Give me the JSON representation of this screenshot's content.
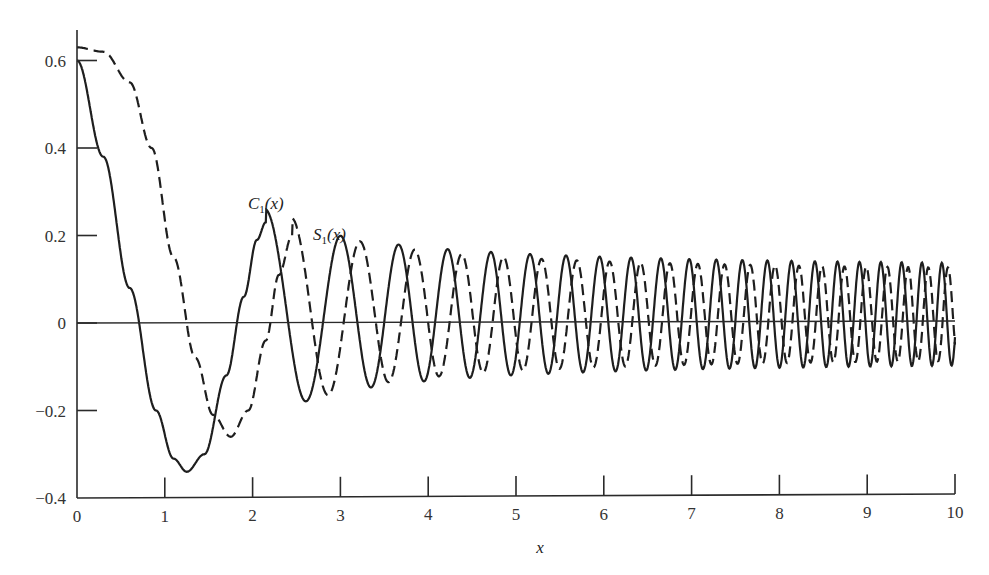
{
  "chart_data": {
    "type": "line",
    "title": "",
    "xlabel": "x",
    "ylabel": "",
    "xlim": [
      0,
      10
    ],
    "ylim": [
      -0.4,
      0.65
    ],
    "grid": false,
    "legend": "inline labels near curves",
    "x_ticks": [
      0,
      1,
      2,
      3,
      4,
      5,
      6,
      7,
      8,
      9,
      10
    ],
    "x_tick_labels": [
      "0",
      "1",
      "2",
      "3",
      "4",
      "5",
      "6",
      "7",
      "8",
      "9",
      "10"
    ],
    "y_ticks": [
      -0.4,
      -0.2,
      0,
      0.2,
      0.4,
      0.6
    ],
    "y_tick_labels": [
      "−0.4",
      "−0.2",
      "0",
      "0.2",
      "0.4",
      "0.6"
    ],
    "zero_line": true,
    "series": [
      {
        "name": "C1(x)",
        "label_main": "C",
        "label_sub": "1",
        "label_arg": "(x)",
        "style": "solid",
        "x": [
          0,
          0.5,
          1.0,
          1.25,
          1.5,
          2.0,
          2.15,
          2.5,
          2.8,
          3.0,
          3.3,
          3.7,
          4.1,
          4.5,
          5.0,
          6.0,
          7.0,
          8.0,
          9.0,
          10.0
        ],
        "y": [
          0.6,
          0.05,
          -0.3,
          -0.34,
          -0.25,
          0.18,
          0.23,
          0.05,
          -0.16,
          -0.12,
          0.15,
          -0.12,
          0.12,
          -0.09,
          0.1,
          0.08,
          0.07,
          0.07,
          0.06,
          0.06
        ]
      },
      {
        "name": "S1(x)",
        "label_main": "S",
        "label_sub": "1",
        "label_arg": "(x)",
        "style": "dashed",
        "x": [
          0,
          0.5,
          1.0,
          1.5,
          1.75,
          2.0,
          2.45,
          2.7,
          3.0,
          3.5,
          3.9,
          4.3,
          4.7,
          5.0,
          6.0,
          7.0,
          8.0,
          9.0,
          10.0
        ],
        "y": [
          0.63,
          0.55,
          0.2,
          -0.2,
          -0.26,
          -0.15,
          0.2,
          0.05,
          -0.15,
          0.15,
          -0.1,
          0.12,
          -0.08,
          0.1,
          0.09,
          0.08,
          0.07,
          0.06,
          0.06
        ]
      }
    ]
  }
}
